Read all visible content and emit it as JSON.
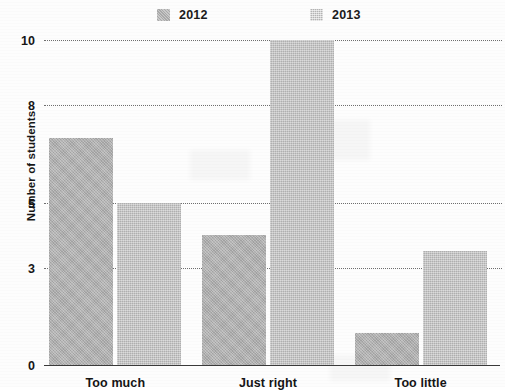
{
  "chart_data": {
    "type": "bar",
    "title": "",
    "xlabel": "",
    "ylabel": "Number of students",
    "categories": [
      "Too much",
      "Just right",
      "Too little"
    ],
    "series": [
      {
        "name": "2012",
        "values": [
          7,
          4,
          1
        ],
        "color": "#b0b0b0"
      },
      {
        "name": "2013",
        "values": [
          5,
          10,
          3.5
        ],
        "color": "#bdbdbd"
      }
    ],
    "ylim": [
      0,
      10
    ],
    "ytick_labels": [
      "0",
      "3",
      "5",
      "8",
      "10"
    ],
    "ytick_values": [
      0,
      3,
      5,
      8,
      10
    ],
    "grid": true,
    "grid_style": "dotted",
    "legend_position": "top-center"
  },
  "legend": {
    "entries": [
      {
        "label": "2012",
        "swatch": "legend-swatch-2012"
      },
      {
        "label": "2013",
        "swatch": "legend-swatch-2013"
      }
    ]
  },
  "axis": {
    "y_title": "Number of students",
    "ticks": [
      {
        "label": "10",
        "value": 10
      },
      {
        "label": "8",
        "value": 8
      },
      {
        "label": "5",
        "value": 5
      },
      {
        "label": "3",
        "value": 3
      },
      {
        "label": "0",
        "value": 0
      }
    ]
  },
  "categories": [
    {
      "label": "Too much"
    },
    {
      "label": "Just right"
    },
    {
      "label": "Too little"
    }
  ],
  "bars": [
    {
      "series": "2012",
      "category": "Too much",
      "value": 7
    },
    {
      "series": "2013",
      "category": "Too much",
      "value": 5
    },
    {
      "series": "2012",
      "category": "Just right",
      "value": 4
    },
    {
      "series": "2013",
      "category": "Just right",
      "value": 10
    },
    {
      "series": "2012",
      "category": "Too little",
      "value": 1
    },
    {
      "series": "2013",
      "category": "Too little",
      "value": 3.5
    }
  ]
}
